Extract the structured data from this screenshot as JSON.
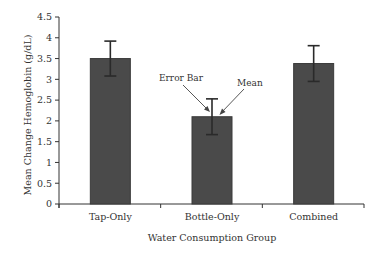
{
  "chart_data": {
    "type": "bar",
    "title": "",
    "xlabel": "Water Consumption Group",
    "ylabel": "Mean Change Hemoglobin (g/dL)",
    "ylim": [
      0,
      4.5
    ],
    "yticks": [
      "0",
      "0.5",
      "1",
      "1.5",
      "2",
      "2.5",
      "3",
      "3.5",
      "4",
      "4.5"
    ],
    "categories": [
      "Tap-Only",
      "Bottle-Only",
      "Combined"
    ],
    "values": [
      3.5,
      2.1,
      3.38
    ],
    "error": [
      0.42,
      0.43,
      0.43
    ],
    "bar_color": "#4a4a4a",
    "grid": false,
    "legend": null,
    "annotations": [
      {
        "text": "Error Bar",
        "points_to": "Bottle-Only error bar"
      },
      {
        "text": "Mean",
        "points_to": "Bottle-Only bar top"
      }
    ]
  }
}
